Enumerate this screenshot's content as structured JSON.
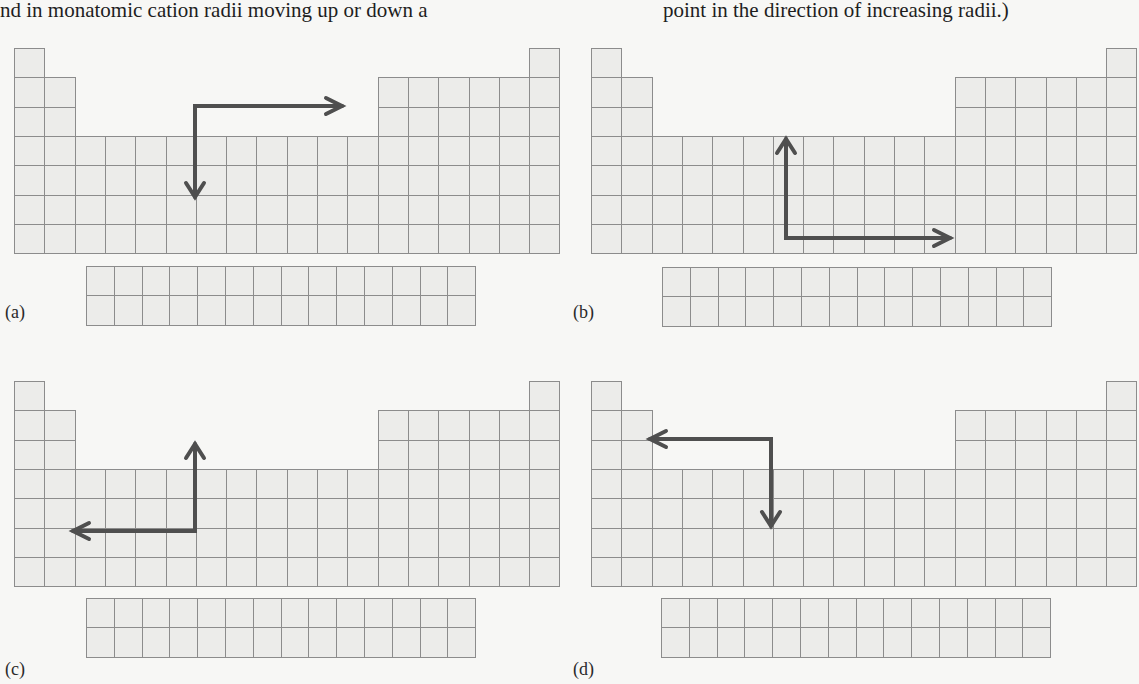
{
  "caption": {
    "left_fragment": "nd in monatomic cation radii moving up or down a",
    "right_fragment": "point in the direction of increasing radii.)"
  },
  "panels": [
    {
      "id": "a",
      "label": "(a)",
      "arrow_description": "from corner, right and down"
    },
    {
      "id": "b",
      "label": "(b)",
      "arrow_description": "from corner, up and right"
    },
    {
      "id": "c",
      "label": "(c)",
      "arrow_description": "from corner, up and left"
    },
    {
      "id": "d",
      "label": "(d)",
      "arrow_description": "from corner, left and down"
    }
  ],
  "grid": {
    "main_columns": 18,
    "main_rows": 7,
    "fblock_columns": 14,
    "fblock_rows": 2,
    "cell_fill": "#ececea",
    "cell_border": "#8c8c8c",
    "arrow_color": "#4f4f4f"
  }
}
